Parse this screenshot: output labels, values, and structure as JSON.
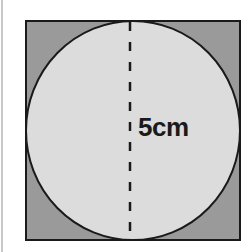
{
  "diagram": {
    "type": "circle-inscribed-in-square",
    "dimension_label": "5cm",
    "colors": {
      "square_fill": "#9a9a9a",
      "circle_fill": "#dcdcdc",
      "stroke": "#1a1a1a"
    }
  }
}
